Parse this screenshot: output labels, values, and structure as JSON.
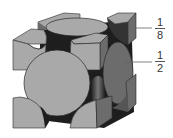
{
  "diagram": {
    "colors": {
      "face_light": "#a9a9a9",
      "face_dark": "#6c6c6c",
      "shadow": "#1e1e1e",
      "outline": "#2a2a2a",
      "leader_line": "#666666"
    },
    "labels": [
      {
        "id": "corner",
        "numerator": "1",
        "denominator": "8",
        "refers_to": "corner atom fraction"
      },
      {
        "id": "face",
        "numerator": "1",
        "denominator": "2",
        "refers_to": "face-centered atom fraction"
      }
    ]
  }
}
